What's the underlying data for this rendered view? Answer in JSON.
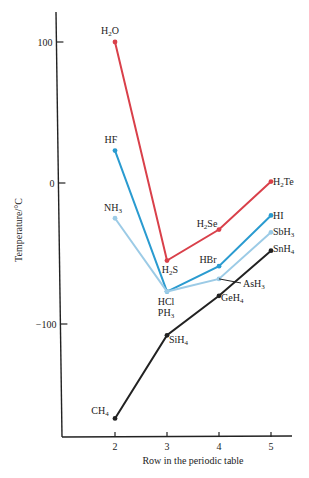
{
  "chart_data": {
    "type": "line",
    "title": "",
    "xlabel": "Row in the periodic table",
    "ylabel": "Temperature/°C",
    "x": [
      2,
      3,
      4,
      5
    ],
    "xticks": [
      "2",
      "3",
      "4",
      "5"
    ],
    "yticks": [
      100,
      0,
      -100
    ],
    "ytick_labels": [
      "100",
      "0",
      "-100"
    ],
    "ylim": [
      -190,
      120
    ],
    "xlim": [
      1,
      5.4
    ],
    "grid": false,
    "legend": "none (direct point labels)",
    "series": [
      {
        "name": "Group 16 hydrides",
        "color": "#d9404a",
        "points": [
          {
            "x": 2,
            "y": 100,
            "label": "H2O"
          },
          {
            "x": 3,
            "y": -55,
            "label": "H2S"
          },
          {
            "x": 4,
            "y": -33,
            "label": "H2Se"
          },
          {
            "x": 5,
            "y": 1,
            "label": "H2Te"
          }
        ]
      },
      {
        "name": "Group 17 hydrides",
        "color": "#2a9bd0",
        "points": [
          {
            "x": 2,
            "y": 23,
            "label": "HF"
          },
          {
            "x": 3,
            "y": -77,
            "label": "HCl"
          },
          {
            "x": 4,
            "y": -59,
            "label": "HBr"
          },
          {
            "x": 5,
            "y": -23,
            "label": "HI"
          }
        ]
      },
      {
        "name": "Group 15 hydrides",
        "color": "#9ccbe6",
        "points": [
          {
            "x": 2,
            "y": -25,
            "label": "NH3"
          },
          {
            "x": 3,
            "y": -77,
            "label": "PH3"
          },
          {
            "x": 4,
            "y": -68,
            "label": "AsH3"
          },
          {
            "x": 5,
            "y": -35,
            "label": "SbH3"
          }
        ]
      },
      {
        "name": "Group 14 hydrides",
        "color": "#222222",
        "points": [
          {
            "x": 2,
            "y": -167,
            "label": "CH4"
          },
          {
            "x": 3,
            "y": -108,
            "label": "SiH4"
          },
          {
            "x": 4,
            "y": -80,
            "label": "GeH4"
          },
          {
            "x": 5,
            "y": -48,
            "label": "SnH4"
          }
        ]
      }
    ]
  },
  "labels": {
    "H2O": [
      "H",
      "2",
      "O"
    ],
    "H2S": [
      "H",
      "2",
      "S"
    ],
    "H2Se": [
      "H",
      "2",
      "Se"
    ],
    "H2Te": [
      "H",
      "2",
      "Te"
    ],
    "HF": [
      "HF",
      "",
      ""
    ],
    "HCl": [
      "HCl",
      "",
      ""
    ],
    "HBr": [
      "HBr",
      "",
      ""
    ],
    "HI": [
      "HI",
      "",
      ""
    ],
    "NH3": [
      "NH",
      "3",
      ""
    ],
    "PH3": [
      "PH",
      "3",
      ""
    ],
    "AsH3": [
      "AsH",
      "3",
      ""
    ],
    "SbH3": [
      "SbH",
      "3",
      ""
    ],
    "CH4": [
      "CH",
      "4",
      ""
    ],
    "SiH4": [
      "SiH",
      "4",
      ""
    ],
    "GeH4": [
      "GeH",
      "4",
      ""
    ],
    "SnH4": [
      "SnH",
      "4",
      ""
    ]
  }
}
